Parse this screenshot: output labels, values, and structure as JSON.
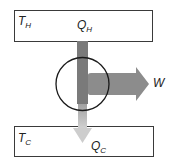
{
  "diagram": {
    "hot_reservoir": {
      "symbol": "T",
      "subscript": "H"
    },
    "cold_reservoir": {
      "symbol": "T",
      "subscript": "C"
    },
    "heat_in": {
      "symbol": "Q",
      "subscript": "H"
    },
    "heat_out": {
      "symbol": "Q",
      "subscript": "C"
    },
    "work": {
      "symbol": "W"
    },
    "colors": {
      "border": "#3a3a3a",
      "heat_in_flow": "#7a7a7a",
      "work_flow": "#8c8c8c",
      "heat_out_start": "#9a9a9a",
      "heat_out_end": "#cfcfcf",
      "engine_outline": "#1a1a1a"
    }
  }
}
